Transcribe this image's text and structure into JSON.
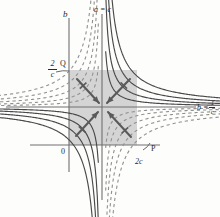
{
  "figure": {
    "background_color": "#fdfdfc",
    "curve_color": "#4a4a4a",
    "dashed_curve_color": "#8a8a8a",
    "axis_color": "#707070",
    "shade_color": "#b0b0b0",
    "arrow_color": "#5a5a5a"
  },
  "axes": {
    "vertical_b_x": 69,
    "vertical_ac_x": 102,
    "horizontal_y": 107,
    "lower_horizontal_y": 145
  },
  "labels": {
    "b_axis": "b",
    "a_equals_c": "a = c",
    "two_over_c_num": "2",
    "two_over_c_den": "c",
    "point_q": "Q",
    "b_equals": "b =",
    "one_over_c_num": "1",
    "one_over_c_den": "c",
    "origin": "0",
    "point_p": "P",
    "two_c": "2c"
  },
  "shaded_square": {
    "x": 69,
    "y": 70,
    "width": 68,
    "height": 75
  },
  "arrows": [
    {
      "name": "arrow-upper-left",
      "x1": 77,
      "y1": 79,
      "x2": 99,
      "y2": 103,
      "direction": "down-right"
    },
    {
      "name": "arrow-upper-right",
      "x1": 130,
      "y1": 79,
      "x2": 107,
      "y2": 103,
      "direction": "down-left"
    },
    {
      "name": "arrow-lower-left",
      "x1": 76,
      "y1": 136,
      "x2": 98,
      "y2": 112,
      "direction": "up-right"
    },
    {
      "name": "arrow-lower-right",
      "x1": 131,
      "y1": 137,
      "x2": 108,
      "y2": 112,
      "direction": "up-left"
    }
  ],
  "curve_sets": [
    {
      "name": "solid-upper-right",
      "style": "solid",
      "count": 4
    },
    {
      "name": "solid-lower-left",
      "style": "solid",
      "count": 4
    },
    {
      "name": "dashed-upper-left",
      "style": "dashed",
      "count": 5
    },
    {
      "name": "dashed-lower-right",
      "style": "dashed",
      "count": 5
    }
  ]
}
